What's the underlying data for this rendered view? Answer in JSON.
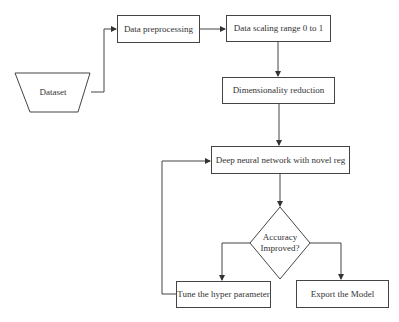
{
  "diagram": {
    "type": "flowchart",
    "nodes": {
      "dataset": {
        "label": "Dataset",
        "shape": "trapezoid"
      },
      "preprocessing": {
        "label": "Data preprocessing",
        "shape": "rectangle"
      },
      "scaling": {
        "label": "Data scaling range 0 to 1",
        "shape": "rectangle"
      },
      "dim_reduction": {
        "label": "Dimensionality reduction",
        "shape": "rectangle"
      },
      "dnn": {
        "label": "Deep neural network with novel reg",
        "shape": "rectangle"
      },
      "decision": {
        "label_line1": "Accuracy",
        "label_line2": "Improved?",
        "shape": "diamond"
      },
      "tune": {
        "label": "Tune the hyper parameter",
        "shape": "rectangle"
      },
      "export": {
        "label": "Export the Model",
        "shape": "rectangle"
      }
    },
    "edges": [
      {
        "from": "Dataset",
        "to": "Data preprocessing"
      },
      {
        "from": "Data preprocessing",
        "to": "Data scaling range 0 to 1"
      },
      {
        "from": "Data scaling range 0 to 1",
        "to": "Dimensionality reduction"
      },
      {
        "from": "Dimensionality reduction",
        "to": "Deep neural network with novel reg"
      },
      {
        "from": "Deep neural network with novel reg",
        "to": "Accuracy Improved?"
      },
      {
        "from": "Accuracy Improved?",
        "to": "Tune the hyper parameter"
      },
      {
        "from": "Accuracy Improved?",
        "to": "Export the Model"
      },
      {
        "from": "Tune the hyper parameter",
        "to": "Deep neural network with novel reg"
      }
    ]
  },
  "colors": {
    "stroke": "#444444",
    "background": "#ffffff",
    "text": "#333333"
  }
}
